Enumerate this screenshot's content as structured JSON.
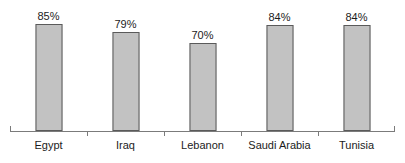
{
  "chart_data": {
    "type": "bar",
    "title": "",
    "subtitle": "",
    "xlabel": "",
    "ylabel": "",
    "ylim": [
      0,
      100
    ],
    "grid": false,
    "legend": false,
    "orientation": "vertical",
    "categories": [
      "Egypt",
      "Iraq",
      "Lebanon",
      "Saudi Arabia",
      "Tunisia"
    ],
    "values": [
      85,
      79,
      70,
      84,
      84
    ],
    "value_labels": [
      "85%",
      "79%",
      "70%",
      "84%",
      "84%"
    ],
    "series": [
      {
        "name": "",
        "values": [
          85,
          79,
          70,
          84,
          84
        ]
      }
    ],
    "colors": {
      "bar_fill": "#c2c2c2",
      "bar_border": "#5a5a5a",
      "axis": "#7b7b7b",
      "text": "#1c1c1c",
      "background": "#ffffff"
    }
  },
  "bars": [
    {
      "category": "Egypt",
      "value": 85,
      "label": "85%"
    },
    {
      "category": "Iraq",
      "value": 79,
      "label": "79%"
    },
    {
      "category": "Lebanon",
      "value": 70,
      "label": "70%"
    },
    {
      "category": "Saudi Arabia",
      "value": 84,
      "label": "84%"
    },
    {
      "category": "Tunisia",
      "value": 84,
      "label": "84%"
    }
  ]
}
